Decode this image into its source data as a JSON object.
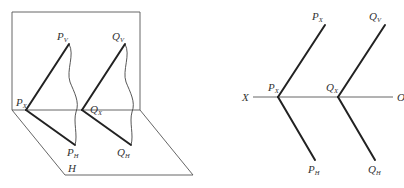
{
  "left_figure": {
    "name": "3d-projection-planes",
    "labels": {
      "pv": {
        "main": "P",
        "sub": "V"
      },
      "qv": {
        "main": "Q",
        "sub": "V"
      },
      "px": {
        "main": "P",
        "sub": "X"
      },
      "qx": {
        "main": "Q",
        "sub": "X"
      },
      "ph": {
        "main": "P",
        "sub": "H"
      },
      "qh": {
        "main": "Q",
        "sub": "H"
      },
      "h_plane": "H"
    }
  },
  "right_figure": {
    "name": "orthographic-traces",
    "axis": {
      "left": "X",
      "right": "O"
    },
    "labels": {
      "pv": {
        "main": "P",
        "sub": "X"
      },
      "qv": {
        "main": "Q",
        "sub": "V"
      },
      "px": {
        "main": "P",
        "sub": "X"
      },
      "qx": {
        "main": "Q",
        "sub": "X"
      },
      "ph": {
        "main": "P",
        "sub": "H"
      },
      "qh": {
        "main": "Q",
        "sub": "H"
      }
    }
  },
  "colors": {
    "line": "#222222",
    "thin_line": "#555555",
    "text": "#333333"
  }
}
